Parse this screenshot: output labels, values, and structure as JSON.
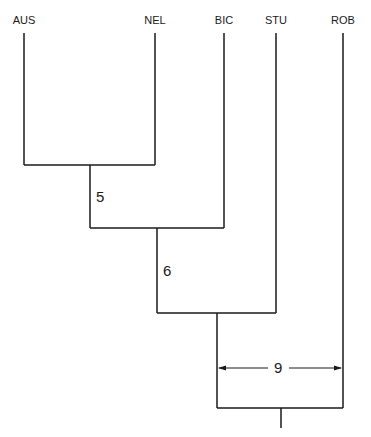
{
  "diagram": {
    "type": "dendrogram",
    "taxa": [
      {
        "label": "AUS",
        "x": 24
      },
      {
        "label": "NEL",
        "x": 155
      },
      {
        "label": "BIC",
        "x": 224
      },
      {
        "label": "STU",
        "x": 276
      },
      {
        "label": "ROB",
        "x": 343
      }
    ],
    "nodes": [
      {
        "joins": [
          "AUS",
          "NEL"
        ],
        "label": "5"
      },
      {
        "joins": [
          "AUS+NEL",
          "BIC"
        ],
        "label": "6"
      },
      {
        "joins": [
          "AUS+NEL+BIC",
          "STU"
        ],
        "label": ""
      },
      {
        "joins": [
          "AUS+NEL+BIC+STU",
          "ROB"
        ],
        "label": "9",
        "label_style": "double-arrow span"
      }
    ],
    "line_color": "#1a1a1a"
  }
}
